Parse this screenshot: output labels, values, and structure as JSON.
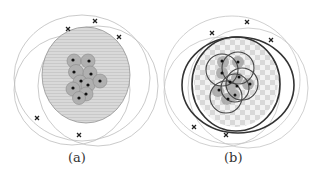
{
  "figure": {
    "panels": [
      {
        "id": "a",
        "caption": "(a)"
      },
      {
        "id": "b",
        "caption": "(b)"
      }
    ],
    "colors": {
      "outer_ring": "#b8b8b8",
      "fill_region": "#d6d6d6",
      "cluster_circle": "#a8a8a8",
      "thick_circle": "#333333",
      "point": "#111111",
      "cross": "#222222"
    }
  }
}
